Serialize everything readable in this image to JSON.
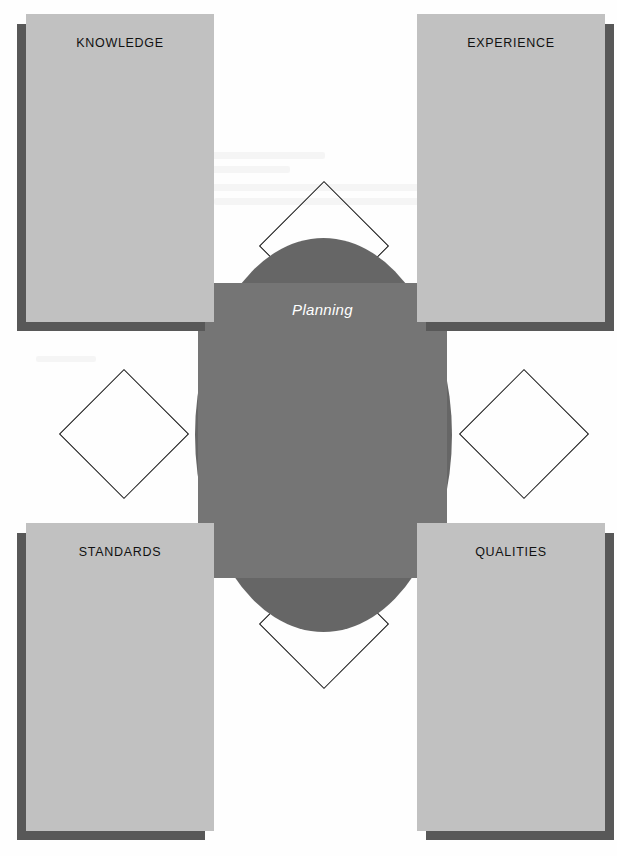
{
  "diagram": {
    "title": "Planning",
    "center": {
      "label": "Planning",
      "circle_color": "#666666",
      "square_color": "#757575",
      "label_color": "#ffffff"
    },
    "quadrants": [
      {
        "id": "knowledge",
        "label": "KNOWLEDGE",
        "position": "top-left",
        "fill": "#c1c1c1",
        "shadow": "#585858"
      },
      {
        "id": "experience",
        "label": "EXPERIENCE",
        "position": "top-right",
        "fill": "#c1c1c1",
        "shadow": "#585858"
      },
      {
        "id": "standards",
        "label": "STANDARDS",
        "position": "bottom-left",
        "fill": "#c1c1c1",
        "shadow": "#585858"
      },
      {
        "id": "qualities",
        "label": "QUALITIES",
        "position": "bottom-right",
        "fill": "#c1c1c1",
        "shadow": "#585858"
      }
    ],
    "connectors": [
      {
        "id": "north",
        "shape": "diamond",
        "stroke": "#111111"
      },
      {
        "id": "south",
        "shape": "diamond",
        "stroke": "#111111"
      },
      {
        "id": "east",
        "shape": "diamond",
        "stroke": "#111111"
      },
      {
        "id": "west",
        "shape": "diamond",
        "stroke": "#111111"
      }
    ],
    "background_color": "#ffffff"
  }
}
